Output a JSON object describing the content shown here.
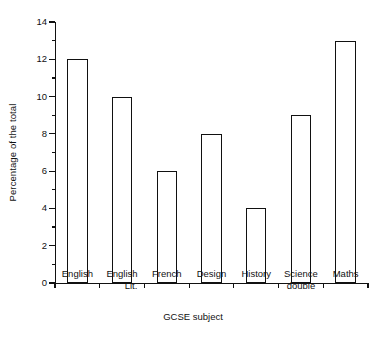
{
  "chart_data": {
    "type": "bar",
    "title": "",
    "xlabel": "GCSE subject",
    "ylabel": "Percentage of the total",
    "categories": [
      "English",
      "English Lit.",
      "French",
      "Design",
      "History",
      "Science double",
      "Maths"
    ],
    "category_lines": [
      [
        "English"
      ],
      [
        "English",
        "Lit."
      ],
      [
        "French"
      ],
      [
        "Design"
      ],
      [
        "History"
      ],
      [
        "Science",
        "double"
      ],
      [
        "Maths"
      ]
    ],
    "values": [
      12,
      10,
      6,
      8,
      4,
      9,
      13
    ],
    "ylim": [
      0,
      14
    ],
    "y_major_ticks": [
      0,
      2,
      4,
      6,
      8,
      10,
      12,
      14
    ],
    "y_major_tick_labels": [
      "0",
      "2",
      "4",
      "6",
      "8",
      "10",
      "12",
      "14"
    ],
    "y_minor_ticks": [
      1,
      3,
      5,
      7,
      9,
      11,
      13
    ],
    "grid": false,
    "legend": null,
    "bar_fill_color": "#ffffff",
    "bar_edge_color": "#111111",
    "axis_color": "#111111",
    "background_color": "#ffffff"
  },
  "figure": {
    "caption_partial": ""
  }
}
